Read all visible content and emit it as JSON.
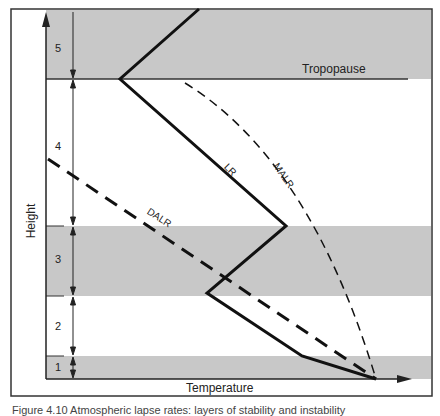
{
  "diagram": {
    "type": "atmospheric lapse rate profile",
    "axes": {
      "x_label": "Temperature",
      "y_label": "Height"
    },
    "layers": [
      {
        "id": "1",
        "label": "1",
        "shaded": true
      },
      {
        "id": "2",
        "label": "2",
        "shaded": false
      },
      {
        "id": "3",
        "label": "3",
        "shaded": true
      },
      {
        "id": "4",
        "label": "4",
        "shaded": false
      },
      {
        "id": "5",
        "label": "5",
        "shaded": true
      }
    ],
    "boundary_labels": {
      "tropopause": "Tropopause"
    },
    "curves": [
      {
        "id": "LR",
        "label": "LR",
        "style": "solid thick"
      },
      {
        "id": "DALR",
        "label": "DALR",
        "style": "long-dash thick"
      },
      {
        "id": "MALR",
        "label": "MALR",
        "style": "short-dash thin"
      }
    ],
    "colors": {
      "band_shade": "#c8c8c8",
      "line": "#111111",
      "frame": "#333333"
    }
  },
  "caption": {
    "text": "Figure 4.10  Atmospheric lapse rates: layers of stability and instability"
  }
}
